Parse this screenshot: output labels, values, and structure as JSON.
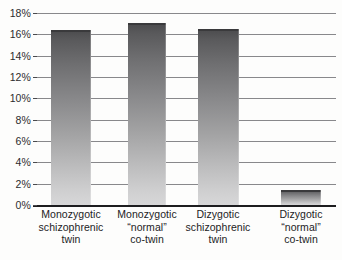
{
  "chart_data": {
    "type": "bar",
    "title": "",
    "subtitle": "",
    "xlabel": "",
    "ylabel": "",
    "ylim": [
      0,
      18
    ],
    "ytick_step": 2,
    "grid": "horizontal",
    "legend": "none",
    "value_suffix": "%",
    "categories": [
      "Monozygotic schizophrenic twin",
      "Monozygotic \"normal\" co-twin",
      "Dizygotic schizophrenic twin",
      "Dizygotic \"normal\" co-twin"
    ],
    "category_lines": [
      [
        "Monozygotic",
        "schizophrenic",
        "twin"
      ],
      [
        "Monozygotic",
        "“normal”",
        "co-twin"
      ],
      [
        "Dizygotic",
        "schizophrenic",
        "twin"
      ],
      [
        "Dizygotic",
        "“normal”",
        "co-twin"
      ]
    ],
    "values": [
      16.4,
      17.1,
      16.5,
      1.4
    ],
    "ytick_labels": [
      "18%",
      "16%",
      "14%",
      "12%",
      "10%",
      "8%",
      "6%",
      "4%",
      "2%",
      "0%"
    ],
    "ytick_values": [
      18,
      16,
      14,
      12,
      10,
      8,
      6,
      4,
      2,
      0
    ],
    "colors": {
      "bar_top": "#4b4b4d",
      "bar_bottom": "#d7d7d8",
      "gridline": "#66666a",
      "axis": "#1d1d1f",
      "text": "#232325",
      "background": "#fdfdfc"
    }
  }
}
